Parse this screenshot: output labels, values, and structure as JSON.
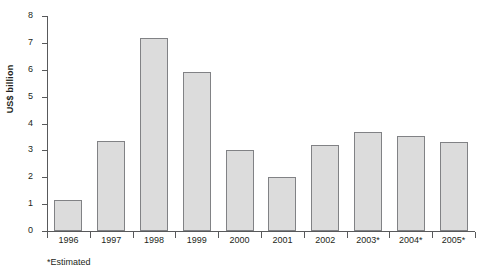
{
  "chart_data": {
    "type": "bar",
    "title": "",
    "subtitle": "",
    "xlabel": "",
    "ylabel": "US$ billion",
    "categories": [
      "1996",
      "1997",
      "1998",
      "1999",
      "2000",
      "2001",
      "2002",
      "2003*",
      "2004*",
      "2005*"
    ],
    "values": [
      1.15,
      3.35,
      7.2,
      5.9,
      3.0,
      2.0,
      3.2,
      3.7,
      3.55,
      3.3
    ],
    "ylim": [
      0,
      8
    ],
    "ytick_labels": [
      "8",
      "7",
      "6",
      "5",
      "4",
      "3",
      "2",
      "1",
      "0"
    ],
    "ytick_values": [
      8,
      7,
      6,
      5,
      4,
      3,
      2,
      1,
      0
    ],
    "grid": false,
    "legend": null,
    "annotations": [
      "*Estimated"
    ],
    "bar_fill_color": "#dcdcdc",
    "bar_border_color": "#818285",
    "axis_color": "#58595b",
    "text_color": "#231f20",
    "background_color": "#ffffff"
  },
  "footnote": "*Estimated"
}
